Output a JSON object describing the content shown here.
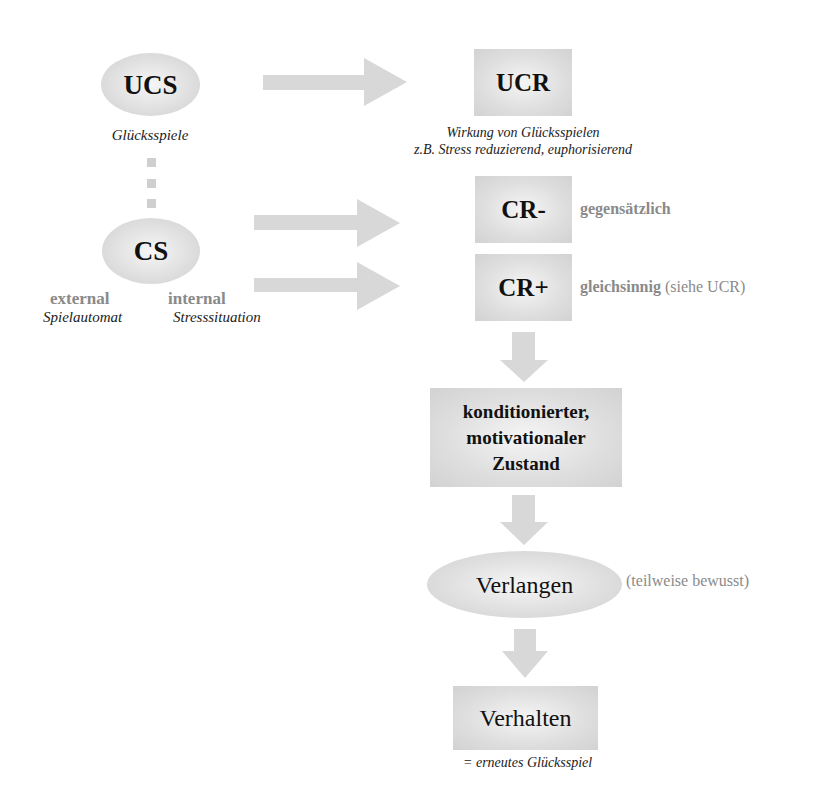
{
  "nodes": {
    "ucs": {
      "label": "UCS",
      "caption": "Glücksspiele"
    },
    "cs": {
      "label": "CS",
      "external": {
        "label": "external",
        "example": "Spielautomat"
      },
      "internal": {
        "label": "internal",
        "example": "Stresssituation"
      }
    },
    "ucr": {
      "label": "UCR",
      "caption_line1": "Wirkung von Glücksspielen",
      "caption_line2": "z.B. Stress reduzierend, euphorisierend"
    },
    "cr_minus": {
      "label": "CR-",
      "note": "gegensätzlich"
    },
    "cr_plus": {
      "label": "CR+",
      "note_bold": "gleichsinnig",
      "note_normal": " (siehe UCR)"
    },
    "state": {
      "line1": "konditionierter,",
      "line2": "motivationaler",
      "line3": "Zustand"
    },
    "craving": {
      "label": "Verlangen",
      "note": "(teilweise bewusst)"
    },
    "behavior": {
      "label": "Verhalten",
      "caption": "= erneutes Glücksspiel"
    }
  },
  "colors": {
    "node_fill": "#dcdcdc",
    "arrow_fill": "#d8d8d8",
    "annotation_text": "#8a8a8a",
    "label_text": "#111111"
  }
}
